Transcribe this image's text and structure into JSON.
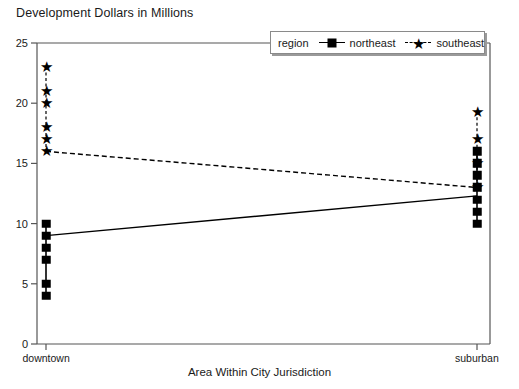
{
  "chart_data": {
    "type": "scatter",
    "title": "Development Dollars in Millions",
    "xlabel": "Area Within City Jurisdiction",
    "ylabel": "",
    "categories": [
      "downtown",
      "suburban"
    ],
    "ylim": [
      0,
      25
    ],
    "yticks": [
      0,
      5,
      10,
      15,
      20,
      25
    ],
    "grid": false,
    "legend": {
      "position": "top-right",
      "title": "region",
      "entries": [
        {
          "name": "northeast",
          "marker": "square",
          "line": "solid"
        },
        {
          "name": "southeast",
          "marker": "star",
          "line": "dashed"
        }
      ]
    },
    "series": [
      {
        "name": "northeast",
        "marker": "square",
        "line": "solid",
        "means": [
          9,
          12.3
        ],
        "points": {
          "downtown": [
            10,
            9,
            8,
            7,
            5,
            4
          ],
          "suburban": [
            16,
            15,
            14,
            13,
            12,
            11,
            10
          ]
        }
      },
      {
        "name": "southeast",
        "marker": "star",
        "line": "dashed",
        "means": [
          16,
          13
        ],
        "points": {
          "downtown": [
            23,
            21,
            20,
            18,
            17,
            16
          ],
          "suburban": [
            19.3,
            17,
            15,
            13
          ]
        }
      }
    ],
    "colors": {
      "marker": "#000000",
      "axis": "#555555",
      "background": "#ffffff"
    }
  }
}
